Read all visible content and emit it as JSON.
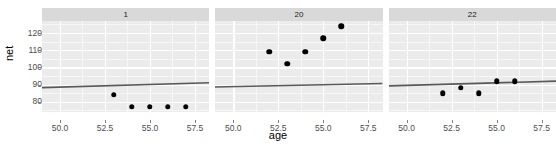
{
  "chart_data": {
    "type": "scatter",
    "title": "",
    "xlabel": "age",
    "ylabel": "net",
    "xlim": [
      49.0,
      58.3
    ],
    "ylim": [
      74.0,
      127.0
    ],
    "xticks": [
      "50.0",
      "52.5",
      "55.0",
      "57.5"
    ],
    "xtick_values": [
      50.0,
      52.5,
      55.0,
      57.5
    ],
    "yticks": [
      "80",
      "90",
      "100",
      "110",
      "120"
    ],
    "ytick_values": [
      80,
      90,
      100,
      110,
      120
    ],
    "grid": true,
    "legend": "none",
    "facet_variable": "",
    "panels": [
      {
        "label": "1",
        "x": [
          53,
          54,
          55,
          56,
          57
        ],
        "y": [
          84,
          77,
          77,
          77,
          77
        ],
        "fit_line": {
          "x": [
            49.0,
            58.3
          ],
          "y": [
            88.2,
            91.0
          ]
        }
      },
      {
        "label": "20",
        "x": [
          52,
          53,
          54,
          55,
          56
        ],
        "y": [
          109,
          102,
          109,
          117,
          124
        ],
        "fit_line": {
          "x": [
            49.0,
            58.3
          ],
          "y": [
            88.6,
            90.6
          ]
        }
      },
      {
        "label": "22",
        "x": [
          52,
          53,
          54,
          55,
          56
        ],
        "y": [
          85,
          88,
          85,
          92,
          92
        ],
        "fit_line": {
          "x": [
            49.0,
            58.3
          ],
          "y": [
            89.2,
            92.0
          ]
        }
      }
    ]
  },
  "style": {
    "panel_background": "#ebebeb",
    "major_gridline": "#ffffff",
    "minor_gridline": "#f7f7f7",
    "strip_background": "#d9d9d9",
    "point_color": "#000000",
    "line_color": "#595959",
    "axis_text_color": "#4d4d4d",
    "title_color": "#000000"
  }
}
